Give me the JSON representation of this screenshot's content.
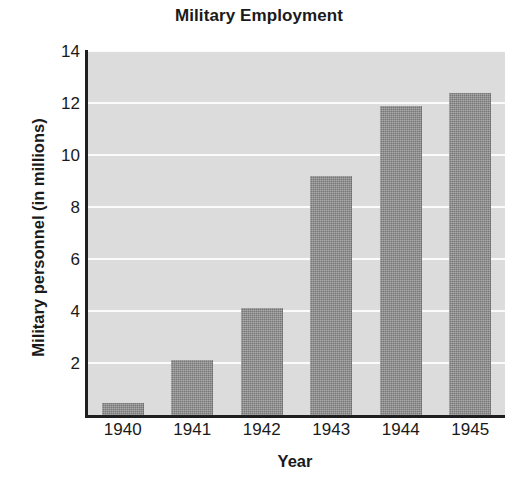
{
  "chart_data": {
    "type": "bar",
    "title": "Military Employment",
    "xlabel": "Year",
    "ylabel": "Military personnel (in millions)",
    "categories": [
      "1940",
      "1941",
      "1942",
      "1943",
      "1944",
      "1945"
    ],
    "values": [
      0.45,
      2.1,
      4.1,
      9.2,
      11.9,
      12.4
    ],
    "ylim": [
      0,
      14
    ],
    "ytick_labels": [
      "2",
      "4",
      "6",
      "8",
      "10",
      "12",
      "14"
    ],
    "yticks": [
      2,
      4,
      6,
      8,
      10,
      12,
      14
    ],
    "grid": "horizontal-white",
    "legend": "none",
    "series_name": "Military personnel",
    "colors": {
      "bar_fill": "#878787",
      "plot_background": "#dcdcdc",
      "gridline": "#fbfbfb",
      "axis_line": "#1f1f1f",
      "text": "#1a1a1a",
      "figure_background": "#ffffff"
    }
  }
}
